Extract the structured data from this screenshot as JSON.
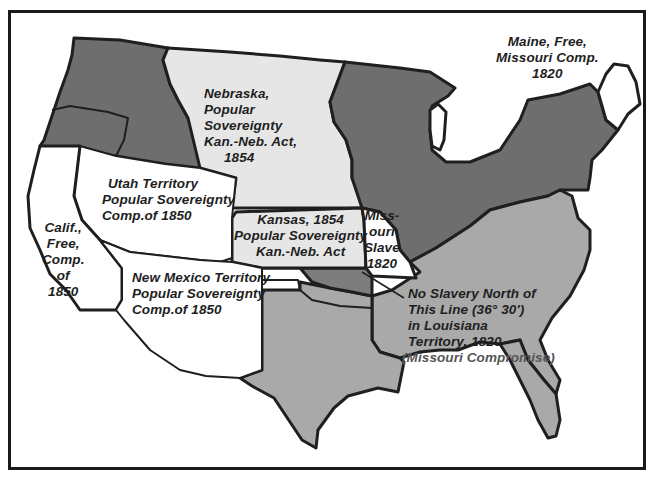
{
  "colors": {
    "border": "#1f1f1f",
    "free_states": "#6e6e6e",
    "slave_states": "#a9a9a9",
    "popular_sovereignty": "#e6e6e6",
    "free_territory": "#ffffff",
    "indian_territory": "#7d7d7d"
  },
  "labels": {
    "maine": [
      "Maine, Free,",
      "Missouri Comp.",
      "1820"
    ],
    "nebraska": [
      "Nebraska,",
      "Popular",
      "Sovereignty",
      "Kan.-Neb. Act,",
      "1854"
    ],
    "utah": [
      "Utah Territory",
      "Popular Sovereignty",
      "Comp.of 1850"
    ],
    "kansas": [
      "Kansas, 1854",
      "Popular Sovereignty",
      "Kan.-Neb. Act"
    ],
    "missouri": [
      "Miss-",
      "ouri",
      "Slave",
      "1820"
    ],
    "california": [
      "Calif.,",
      "Free,",
      "Comp.",
      "of",
      "1850"
    ],
    "new_mexico": [
      "New Mexico Territory",
      "Popular Sovereignty",
      "Comp.of 1850"
    ],
    "line_note": [
      "No Slavery North of",
      "This Line (36° 30')",
      "in Louisiana",
      "Territory, 1820"
    ],
    "line_note_sub": "(Missouri Compromise)"
  }
}
